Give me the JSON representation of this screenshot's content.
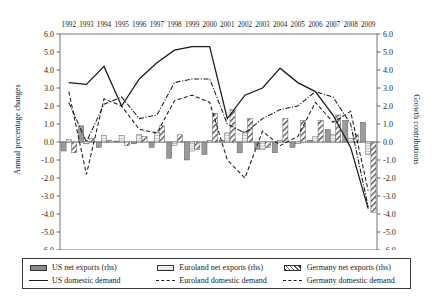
{
  "chart_data": {
    "type": "bar",
    "title": "",
    "subtitle": "",
    "xlabel": "",
    "ylabel": "Annual percentage changes",
    "y2label": "Growth contributions",
    "grid": false,
    "legend_position": "bottom",
    "ylim": [
      -6.0,
      6.0
    ],
    "y2lim": [
      -6.0,
      6.0
    ],
    "ytick_labels": [
      "6.0",
      "5.0",
      "4.0",
      "3.0",
      "2.0",
      "1.0",
      "0.0",
      "-1.0",
      "-2.0",
      "-3.0",
      "-4.0",
      "-5.0",
      "-6.0"
    ],
    "y2tick_labels": [
      "6.0",
      "5.0",
      "4.0",
      "3.0",
      "2.0",
      "1.0",
      "0.0",
      "-1.0",
      "-2.0",
      "-3.0",
      "-4.0",
      "-5.0",
      "-6.0"
    ],
    "ytick_values": [
      6,
      5,
      4,
      3,
      2,
      1,
      0,
      -1,
      -2,
      -3,
      -4,
      -5,
      -6
    ],
    "categories": [
      "1992",
      "1993",
      "1994",
      "1995",
      "1996",
      "1997",
      "1998",
      "1999",
      "2000",
      "2001",
      "2002",
      "2003",
      "2004",
      "2005",
      "2006",
      "2007",
      "2008",
      "2009"
    ],
    "bar_series": [
      {
        "name": "US net exports (rhs)",
        "axis": "right",
        "style": "solid-grey",
        "values": [
          -0.5,
          0.9,
          -0.3,
          0.05,
          -0.1,
          -0.3,
          -0.9,
          -1.0,
          -0.7,
          0.1,
          -0.6,
          -0.4,
          -0.6,
          -0.3,
          0.1,
          0.7,
          1.2,
          1.1
        ]
      },
      {
        "name": "Euroland net exports (rhs)",
        "axis": "right",
        "style": "horizontal-hatch",
        "values": [
          0.15,
          -0.1,
          0.35,
          0.35,
          0.4,
          0.55,
          -0.2,
          -0.5,
          0.1,
          0.5,
          0.6,
          -0.4,
          0.1,
          -0.1,
          0.3,
          0.4,
          0.2,
          -0.7
        ]
      },
      {
        "name": "Germany net exports (rhs)",
        "axis": "right",
        "style": "diagonal-hatch",
        "values": [
          -0.6,
          0.2,
          0.1,
          -0.2,
          0.3,
          0.9,
          0.4,
          -0.4,
          1.6,
          1.8,
          1.3,
          -0.3,
          1.3,
          1.2,
          1.2,
          1.5,
          0.4,
          -3.9
        ]
      }
    ],
    "line_series": [
      {
        "name": "US domestic demand",
        "axis": "left",
        "style": "solid",
        "values": [
          3.3,
          3.2,
          4.2,
          2.0,
          3.5,
          4.4,
          5.1,
          5.3,
          5.3,
          1.3,
          2.6,
          3.0,
          4.1,
          3.3,
          2.8,
          1.5,
          -0.3,
          -3.7
        ]
      },
      {
        "name": "Euroland domestic demand",
        "axis": "left",
        "style": "dash-dot",
        "values": [
          2.2,
          0.0,
          2.1,
          2.5,
          1.3,
          1.5,
          3.3,
          3.5,
          3.5,
          1.0,
          0.5,
          1.3,
          1.8,
          2.0,
          2.8,
          2.5,
          1.0,
          -3.6
        ]
      },
      {
        "name": "Germany domestic demand",
        "axis": "left",
        "style": "dashed",
        "values": [
          2.8,
          -1.8,
          2.4,
          2.0,
          0.7,
          0.5,
          2.3,
          2.6,
          2.2,
          -1.0,
          -2.0,
          0.6,
          -0.2,
          0.3,
          2.2,
          1.1,
          1.7,
          -2.7
        ]
      }
    ]
  },
  "legend": {
    "entries": [
      {
        "label": "US net exports (rhs)",
        "swatch": "bar-solid-grey-icon"
      },
      {
        "label": "Euroland net exports (rhs)",
        "swatch": "bar-horizontal-hatch-icon"
      },
      {
        "label": "Germany net exports (rhs)",
        "swatch": "bar-diagonal-hatch-icon"
      },
      {
        "label": "US domestic demand",
        "swatch": "line-solid-icon"
      },
      {
        "label": "Euroland domestic demand",
        "swatch": "line-dash-dot-icon"
      },
      {
        "label": "Germany domestic demand",
        "swatch": "line-dashed-icon"
      }
    ]
  }
}
